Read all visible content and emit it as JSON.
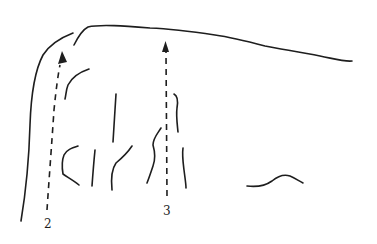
{
  "diagram": {
    "type": "line-sketch",
    "colors": {
      "ink": "#1e1e1e",
      "background": "#ffffff"
    },
    "arrows": [
      {
        "id": "arrow-2",
        "label": "2",
        "style": "dashed",
        "direction": "up"
      },
      {
        "id": "arrow-3",
        "label": "3",
        "style": "dashed",
        "direction": "up"
      }
    ]
  }
}
